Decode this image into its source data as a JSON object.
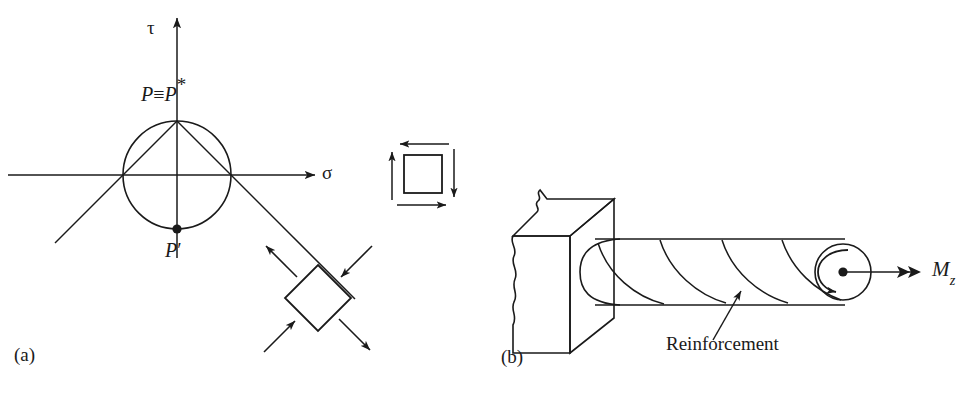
{
  "figure": {
    "background_color": "#ffffff",
    "ink_color": "#1a1a1a",
    "width": 977,
    "height": 400,
    "caption_style": "two-panel engineering mechanics figure"
  },
  "panel_a": {
    "tag": "(a)",
    "title_semantic": "Mohr circle for pure shear with stress elements",
    "axes": {
      "vertical_label": "τ",
      "horizontal_label": "σ",
      "vertical_axis_x": 177,
      "horizontal_axis_y": 175
    },
    "circle": {
      "center_x": 177,
      "center_y": 175,
      "radius": 54
    },
    "points": [
      {
        "name": "top-point",
        "label_text": "P",
        "label_equiv": "≡",
        "label_second": "P",
        "label_star": "*",
        "full_label": "P ≡ P*",
        "x": 177,
        "y": 121,
        "marker": "none"
      },
      {
        "name": "bottom-point",
        "label_text": "P",
        "label_prime": "′",
        "full_label": "P′",
        "x": 177,
        "y": 229,
        "marker": "filled-dot"
      }
    ],
    "chords": [
      {
        "name": "chord-left",
        "from": [
          177,
          121
        ],
        "to": [
          123,
          175
        ],
        "extends_to": [
          55,
          243
        ]
      },
      {
        "name": "chord-right",
        "from": [
          177,
          121
        ],
        "to": [
          231,
          175
        ],
        "extends_to": [
          355,
          299
        ]
      }
    ],
    "square_element": {
      "name": "pure-shear-square",
      "x": 404,
      "y": 155,
      "size": 38,
      "arrows": [
        {
          "name": "arrow-top-left",
          "direction": "left",
          "edge": "top"
        },
        {
          "name": "arrow-bottom-right",
          "direction": "right",
          "edge": "bottom"
        },
        {
          "name": "arrow-left-up",
          "direction": "up",
          "edge": "left"
        },
        {
          "name": "arrow-right-down",
          "direction": "down",
          "edge": "right"
        }
      ]
    },
    "rotated_element": {
      "name": "principal-stress-diamond",
      "center_x": 318,
      "center_y": 298,
      "half_diagonal": 33,
      "rotation_deg": 45,
      "arrows": [
        {
          "name": "arrow-tension-upper-left",
          "direction": "outward",
          "axis": "NW"
        },
        {
          "name": "arrow-tension-lower-right",
          "direction": "outward",
          "axis": "SE"
        },
        {
          "name": "arrow-compression-upper-right",
          "direction": "inward",
          "axis": "NE"
        },
        {
          "name": "arrow-compression-lower-left",
          "direction": "inward",
          "axis": "SW"
        }
      ]
    }
  },
  "panel_b": {
    "tag": "(b)",
    "title_semantic": "Cantilever shaft built into wall with helical reinforcement under torque",
    "wall_block": {
      "name": "support-wall-block",
      "description": "broken/torn masonry block with jagged left edge"
    },
    "shaft": {
      "name": "cylindrical-shaft",
      "left_x": 588,
      "right_x": 852,
      "top_y": 239,
      "bottom_y": 305,
      "helix_count": 4
    },
    "end_face": {
      "name": "shaft-end-face",
      "center_x": 843,
      "center_y": 272,
      "radius": 28,
      "spin_arrow": "counterclockwise-curved-arrow",
      "center_dot": true
    },
    "reinforcement_label": {
      "text": "Reinforcement",
      "x": 668,
      "y": 346,
      "leader_from": [
        714,
        341
      ],
      "leader_to": [
        739,
        292
      ]
    },
    "torque": {
      "label_base": "M",
      "label_sub": "z",
      "full_label": "Mz",
      "arrow_style": "double-arrowhead-vector",
      "arrow_from": [
        848,
        272
      ],
      "arrow_to": [
        928,
        272
      ],
      "label_x": 935,
      "label_y": 262
    }
  }
}
